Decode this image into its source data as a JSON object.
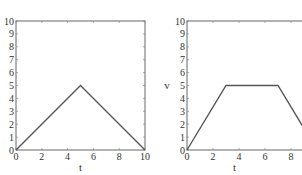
{
  "chart_data": [
    {
      "type": "line",
      "title": "",
      "xlabel": "t",
      "ylabel": "",
      "xlim": [
        0,
        10
      ],
      "ylim": [
        0,
        10
      ],
      "xticks": [
        "0",
        "2",
        "4",
        "6",
        "8",
        "10"
      ],
      "yticks": [
        "0",
        "1",
        "2",
        "3",
        "4",
        "5",
        "6",
        "7",
        "8",
        "9",
        "10"
      ],
      "grid": false,
      "series": [
        {
          "name": "triangle",
          "x": [
            0,
            5,
            10
          ],
          "y": [
            0,
            5,
            0
          ],
          "color": "#555555"
        }
      ]
    },
    {
      "type": "line",
      "title": "",
      "xlabel": "t",
      "ylabel": "v",
      "xlim": [
        0,
        10
      ],
      "ylim": [
        0,
        10
      ],
      "xticks": [
        "0",
        "2",
        "4",
        "6",
        "8"
      ],
      "yticks": [
        "0",
        "1",
        "2",
        "3",
        "4",
        "5",
        "6",
        "7",
        "8",
        "9",
        "10"
      ],
      "grid": false,
      "series": [
        {
          "name": "trapezoid",
          "x": [
            0,
            3,
            7,
            10
          ],
          "y": [
            0,
            5,
            5,
            0
          ],
          "color": "#555555"
        }
      ]
    }
  ],
  "labels": {
    "left_xlabel": "t",
    "right_xlabel": "t",
    "right_ylabel": "v"
  }
}
